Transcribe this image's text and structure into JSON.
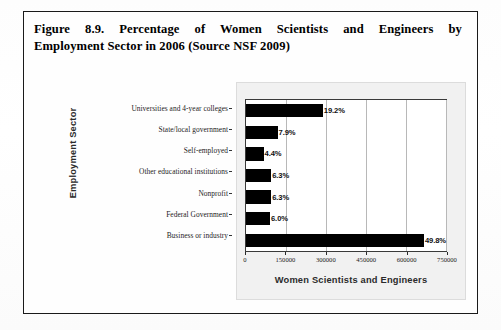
{
  "figure": {
    "caption_line1": "Figure 8.9. Percentage of Women Scientists and Engineers by",
    "caption_line2": "Employment Sector in 2006 (Source NSF 2009)"
  },
  "chart_data": {
    "type": "bar",
    "orientation": "horizontal",
    "title": "",
    "xlabel": "Women Scientists and Engineers",
    "ylabel": "Employment Sector",
    "categories": [
      "Universities and 4-year colleges",
      "State/local government",
      "Self-employed",
      "Other educational institutions",
      "Nonprofit",
      "Federal Government",
      "Business or industry"
    ],
    "values": [
      288000,
      118500,
      66000,
      94500,
      94500,
      90000,
      747000
    ],
    "data_labels": [
      "19.2%",
      "7.9%",
      "4.4%",
      "6.3%",
      "6.3%",
      "6.0%",
      "49.8%"
    ],
    "percentages": [
      19.2,
      7.9,
      4.4,
      6.3,
      6.3,
      6.0,
      49.8
    ],
    "xlim": [
      0,
      750000
    ],
    "xticks": [
      0,
      150000,
      300000,
      450000,
      600000,
      750000
    ],
    "xtick_labels": [
      "0",
      "150000",
      "300000",
      "450000",
      "600000",
      "750000"
    ],
    "grid": true,
    "legend": "none",
    "bar_color": "#000000",
    "panel_color": "#f1f1f1"
  }
}
